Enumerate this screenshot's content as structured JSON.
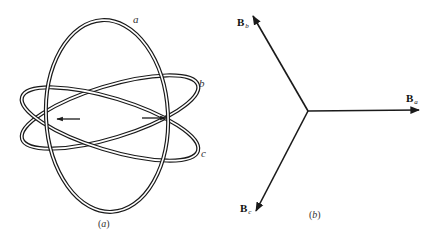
{
  "figure": {
    "panel_a": {
      "caption_open": "(",
      "caption_letter": "a",
      "caption_close": ")",
      "coils": [
        {
          "id": "a",
          "label": "a"
        },
        {
          "id": "b",
          "label": "b"
        },
        {
          "id": "c",
          "label": "c"
        }
      ],
      "arrows": [
        {
          "name": "left-arrow",
          "direction": "left"
        },
        {
          "name": "right-arrow",
          "direction": "right"
        }
      ]
    },
    "panel_b": {
      "caption_open": "(",
      "caption_letter": "b",
      "caption_close": ")",
      "vectors": [
        {
          "id": "Ba",
          "base": "B",
          "subscript": "a",
          "angle_deg": 0
        },
        {
          "id": "Bb",
          "base": "B",
          "subscript": "b",
          "angle_deg": 120
        },
        {
          "id": "Bc",
          "base": "B",
          "subscript": "c",
          "angle_deg": 240
        }
      ]
    },
    "colors": {
      "stroke": "#1a1a1a",
      "background": "#ffffff"
    }
  }
}
